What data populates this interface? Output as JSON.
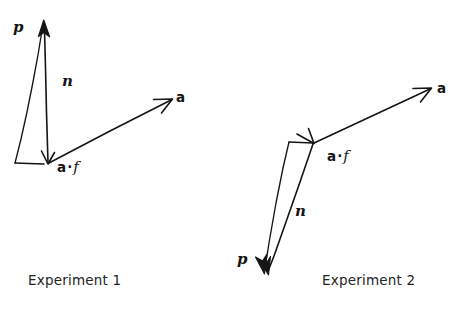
{
  "figure": {
    "background_color": "#ffffff",
    "ink_color": "#151515",
    "panels": [
      {
        "id": "experiment-1",
        "caption": "Experiment 1",
        "caption_x": 28,
        "caption_y": 272,
        "labels": {
          "p": "p",
          "n": "n",
          "a": "a",
          "a_dot_f_first": "a",
          "a_dot_f_dot": "·",
          "a_dot_f_second": "f"
        },
        "label_positions": {
          "p": {
            "x": 13,
            "y": 20
          },
          "n": {
            "x": 62,
            "y": 74
          },
          "a": {
            "x": 176,
            "y": 91
          },
          "a_dot_f": {
            "x": 57,
            "y": 160
          }
        },
        "geometry": {
          "origin": {
            "x": 48,
            "y": 163
          },
          "n_tip": {
            "x": 44,
            "y": 22
          },
          "p_base": {
            "x": 15,
            "y": 163
          },
          "p_tip": {
            "x": 44,
            "y": 22
          },
          "a_tip": {
            "x": 172,
            "y": 99
          }
        }
      },
      {
        "id": "experiment-2",
        "caption": "Experiment 2",
        "caption_x": 322,
        "caption_y": 272,
        "labels": {
          "p": "p",
          "n": "n",
          "a": "a",
          "a_dot_f_first": "a",
          "a_dot_f_dot": "·",
          "a_dot_f_second": "f"
        },
        "label_positions": {
          "p": {
            "x": 237,
            "y": 252
          },
          "n": {
            "x": 295,
            "y": 204
          },
          "a": {
            "x": 437,
            "y": 82
          },
          "a_dot_f": {
            "x": 327,
            "y": 149
          }
        },
        "geometry": {
          "apex": {
            "x": 313,
            "y": 143
          },
          "n_tip": {
            "x": 267,
            "y": 272
          },
          "p_base": {
            "x": 289,
            "y": 142
          },
          "p_tip": {
            "x": 264,
            "y": 272
          },
          "a_tip": {
            "x": 431,
            "y": 88
          },
          "a_origin": {
            "x": 313,
            "y": 143
          }
        }
      }
    ]
  }
}
